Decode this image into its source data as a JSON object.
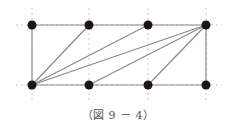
{
  "figure": {
    "caption": "（図 9 － 4）",
    "colors": {
      "line": "#8a8a8a",
      "guide": "#c8c8c8",
      "dot": "#1e1414"
    },
    "points": [
      {
        "id": "T1",
        "x": 32,
        "y": 25
      },
      {
        "id": "T2",
        "x": 89,
        "y": 25
      },
      {
        "id": "T3",
        "x": 148,
        "y": 25
      },
      {
        "id": "T4",
        "x": 206,
        "y": 25
      },
      {
        "id": "B1",
        "x": 32,
        "y": 85
      },
      {
        "id": "B2",
        "x": 89,
        "y": 85
      },
      {
        "id": "B3",
        "x": 148,
        "y": 85
      },
      {
        "id": "B4",
        "x": 206,
        "y": 85
      }
    ],
    "edges": [
      [
        "T1",
        "T4"
      ],
      [
        "B1",
        "B4"
      ],
      [
        "T1",
        "B1"
      ],
      [
        "T4",
        "B4"
      ],
      [
        "B1",
        "T2"
      ],
      [
        "B1",
        "T3"
      ],
      [
        "B1",
        "T4"
      ],
      [
        "B2",
        "T4"
      ],
      [
        "B3",
        "T4"
      ]
    ],
    "guides": {
      "vertical_x": [
        32,
        89,
        148,
        206
      ],
      "horizontal_y": [
        25,
        85
      ],
      "v_extent": [
        8,
        100
      ],
      "h_extent": [
        16,
        222
      ]
    }
  }
}
